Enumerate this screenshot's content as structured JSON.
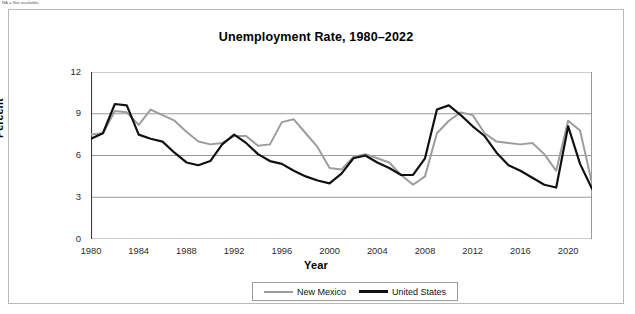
{
  "footnote": "NA = Not available.",
  "chart_title": "Unemployment Rate, 1980–2022",
  "axis": {
    "x_title": "Year",
    "y_title": "Percent",
    "y_ticks": [
      "0",
      "3",
      "6",
      "9",
      "12"
    ],
    "x_ticks": [
      "1980",
      "1984",
      "1988",
      "1992",
      "1996",
      "2000",
      "2004",
      "2008",
      "2012",
      "2016",
      "2020"
    ]
  },
  "legend": {
    "items": [
      {
        "label": "New Mexico",
        "color": "#9d9d9d"
      },
      {
        "label": "United States",
        "color": "#111111"
      }
    ]
  },
  "chart_data": {
    "type": "line",
    "title": "Unemployment Rate, 1980–2022",
    "xlabel": "Year",
    "ylabel": "Percent",
    "xlim": [
      1980,
      2022
    ],
    "ylim": [
      0,
      12
    ],
    "y_ticks": [
      0,
      3,
      6,
      9,
      12
    ],
    "x_ticks": [
      1980,
      1984,
      1988,
      1992,
      1996,
      2000,
      2004,
      2008,
      2012,
      2016,
      2020
    ],
    "x_minor_tick_interval": 1,
    "grid": "horizontal",
    "legend_position": "bottom",
    "x": [
      1980,
      1981,
      1982,
      1983,
      1984,
      1985,
      1986,
      1987,
      1988,
      1989,
      1990,
      1991,
      1992,
      1993,
      1994,
      1995,
      1996,
      1997,
      1998,
      1999,
      2000,
      2001,
      2002,
      2003,
      2004,
      2005,
      2006,
      2007,
      2008,
      2009,
      2010,
      2011,
      2012,
      2013,
      2014,
      2015,
      2016,
      2017,
      2018,
      2019,
      2020,
      2021,
      2022
    ],
    "series": [
      {
        "name": "New Mexico",
        "color": "#9d9d9d",
        "values": [
          7.5,
          7.6,
          9.2,
          9.1,
          8.2,
          9.3,
          8.9,
          8.5,
          7.7,
          7.0,
          6.8,
          6.9,
          7.4,
          7.4,
          6.7,
          6.8,
          8.4,
          8.6,
          7.6,
          6.6,
          5.1,
          5.0,
          5.9,
          6.1,
          5.8,
          5.5,
          4.6,
          3.9,
          4.5,
          7.6,
          8.5,
          9.1,
          8.9,
          7.6,
          7.0,
          6.9,
          6.8,
          6.9,
          6.1,
          4.9,
          8.5,
          7.8,
          4.0
        ],
        "marker": "none"
      },
      {
        "name": "United States",
        "color": "#111111",
        "values": [
          7.2,
          7.6,
          9.7,
          9.6,
          7.5,
          7.2,
          7.0,
          6.2,
          5.5,
          5.3,
          5.6,
          6.8,
          7.5,
          6.9,
          6.1,
          5.6,
          5.4,
          4.9,
          4.5,
          4.2,
          4.0,
          4.7,
          5.8,
          6.0,
          5.5,
          5.1,
          4.6,
          4.6,
          5.8,
          9.3,
          9.6,
          8.9,
          8.1,
          7.4,
          6.2,
          5.3,
          4.9,
          4.4,
          3.9,
          3.7,
          8.1,
          5.4,
          3.6
        ],
        "marker": "none"
      }
    ]
  }
}
